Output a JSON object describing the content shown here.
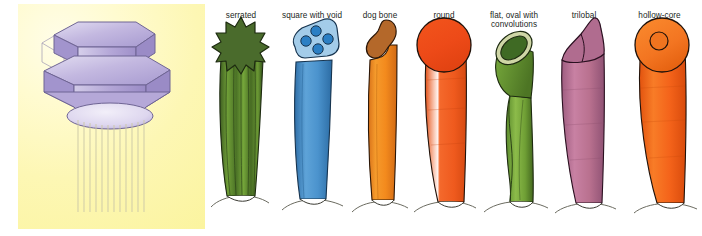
{
  "figure": {
    "background_color": "#ffffff"
  },
  "left_panel": {
    "name": "spinneret-illustration",
    "background_gradient_from": "#fffde8",
    "background_gradient_to": "#fbf49f",
    "device_color": "#b9aedb",
    "device_highlight": "#d9d2ee",
    "device_outline": "#6f6594",
    "filament_color": "#cdc9a8",
    "filament_count": 12,
    "description": "Two-tier hexagonal spinneret extruding vertical filaments"
  },
  "gallery": {
    "name": "fiber-cross-section-gallery",
    "fibers": [
      {
        "id": "serrated",
        "label": "serrated",
        "shape": "star",
        "cross_section_color": "#4a6b2c",
        "body_color": "#6b9a33",
        "outline_color": "#1d2a10",
        "points": 11
      },
      {
        "id": "square-with-void",
        "label": "square with void",
        "shape": "rounded-square-with-voids",
        "cross_section_color": "#a3cce9",
        "void_color": "#2b7fc4",
        "body_color": "#4e9bd1",
        "outline_color": "#17344f",
        "void_count": 4
      },
      {
        "id": "dog-bone",
        "label": "dog bone",
        "shape": "peanut",
        "cross_section_color": "#b4682a",
        "body_color": "#f08a20",
        "outline_color": "#2a1607"
      },
      {
        "id": "round",
        "label": "round",
        "shape": "circle",
        "cross_section_color": "#ed4a18",
        "body_color": "#ef5a1e",
        "outline_color": "#20120a"
      },
      {
        "id": "flat-oval-with-convolutions",
        "label": "flat, oval with convolutions",
        "shape": "oval-ring",
        "cross_section_color": "#3f6a24",
        "rim_color": "#cfd6a6",
        "body_color": "#7cab3c",
        "outline_color": "#1d2a10"
      },
      {
        "id": "trilobal",
        "label": "trilobal",
        "shape": "three-lobed",
        "cross_section_color": "#b06c8f",
        "body_color": "#bd7496",
        "outline_color": "#2a1020"
      },
      {
        "id": "hollow-core",
        "label": "hollow-core",
        "shape": "annulus",
        "cross_section_color": "#f37521",
        "hole_color": "#f0741f",
        "body_color": "#f4631a",
        "outline_color": "#20120a"
      }
    ]
  }
}
